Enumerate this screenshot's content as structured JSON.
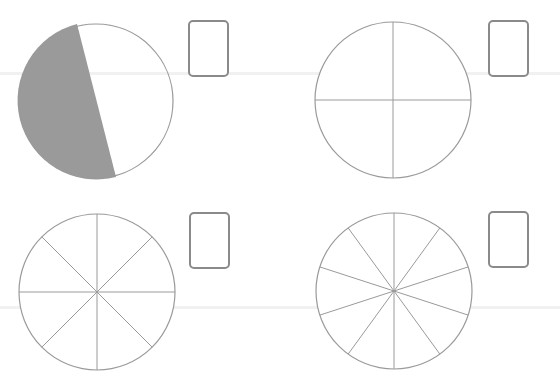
{
  "worksheet": {
    "items": [
      {
        "id": "circle-halves",
        "parts": 2,
        "shaded_parts": 1,
        "center": [
          96,
          101
        ],
        "radius": 77,
        "divider": [
          [
            77,
            24
          ],
          [
            116,
            177
          ]
        ],
        "shade_color": "#9a9a9a",
        "answer_box": {
          "x": 188,
          "y": 20,
          "value": ""
        }
      },
      {
        "id": "circle-quarters",
        "parts": 4,
        "shaded_parts": 0,
        "center": [
          393,
          100
        ],
        "radius": 78,
        "spoke_start_deg": 0,
        "answer_box": {
          "x": 488,
          "y": 20,
          "value": ""
        }
      },
      {
        "id": "circle-eighths",
        "parts": 8,
        "shaded_parts": 0,
        "center": [
          97,
          292
        ],
        "radius": 78,
        "spoke_start_deg": 0,
        "answer_box": {
          "x": 189,
          "y": 212,
          "value": ""
        }
      },
      {
        "id": "circle-tenths",
        "parts": 10,
        "shaded_parts": 0,
        "center": [
          394,
          291
        ],
        "radius": 78,
        "spoke_start_deg": 0,
        "answer_box": {
          "x": 488,
          "y": 211,
          "value": ""
        }
      }
    ],
    "colors": {
      "stroke": "#9a9a9a",
      "box_border": "#8a8a8a",
      "background": "#ffffff"
    }
  }
}
